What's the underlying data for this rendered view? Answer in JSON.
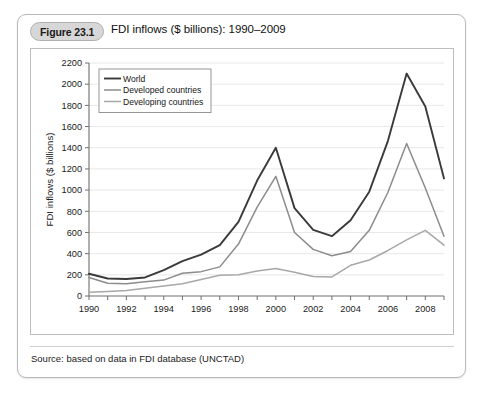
{
  "figure": {
    "badge": "Figure 23.1",
    "title": "FDI inflows ($ billions): 1990–2009",
    "source": "Source: based on data in FDI database (UNCTAD)"
  },
  "colors": {
    "card_border": "#b9b9b9",
    "badge_bg": "#d7d7d7",
    "plot_border": "#bdbdbd",
    "grid": "#e2e2e2",
    "axis": "#6f6f6f",
    "world": "#3a3a3a",
    "developed": "#8c8c8c",
    "developing": "#a8a8a8"
  },
  "chart_data": {
    "type": "line",
    "title": "FDI inflows ($ billions): 1990–2009",
    "xlabel": "",
    "ylabel": "FDI inflows ($ billions)",
    "xlim": [
      1990,
      2009
    ],
    "ylim": [
      0,
      2200
    ],
    "grid": true,
    "legend_position": "top-left",
    "ytick_labels": [
      "0",
      "200",
      "400",
      "600",
      "800",
      "1000",
      "1200",
      "1400",
      "1600",
      "1800",
      "2000",
      "2200"
    ],
    "yticks": [
      0,
      200,
      400,
      600,
      800,
      1000,
      1200,
      1400,
      1600,
      1800,
      2000,
      2200
    ],
    "xticks": [
      1990,
      1991,
      1992,
      1993,
      1994,
      1995,
      1996,
      1997,
      1998,
      1999,
      2000,
      2001,
      2002,
      2003,
      2004,
      2005,
      2006,
      2007,
      2008,
      2009
    ],
    "xtick_labels_shown": [
      "1990",
      "1992",
      "1994",
      "1996",
      "1998",
      "2000",
      "2002",
      "2004",
      "2006",
      "2008"
    ],
    "x": [
      1990,
      1991,
      1992,
      1993,
      1994,
      1995,
      1996,
      1997,
      1998,
      1999,
      2000,
      2001,
      2002,
      2003,
      2004,
      2005,
      2006,
      2007,
      2008,
      2009
    ],
    "series": [
      {
        "name": "World",
        "color": "#3a3a3a",
        "values": [
          210,
          165,
          160,
          175,
          245,
          330,
          390,
          480,
          700,
          1090,
          1400,
          830,
          625,
          565,
          715,
          985,
          1465,
          2100,
          1790,
          1110
        ]
      },
      {
        "name": "Developed countries",
        "color": "#8c8c8c",
        "values": [
          175,
          120,
          115,
          135,
          150,
          215,
          230,
          275,
          490,
          840,
          1130,
          600,
          440,
          380,
          420,
          620,
          980,
          1440,
          1020,
          565
        ]
      },
      {
        "name": "Developing countries",
        "color": "#a8a8a8",
        "values": [
          35,
          42,
          52,
          73,
          95,
          115,
          155,
          195,
          200,
          235,
          260,
          225,
          185,
          180,
          290,
          340,
          430,
          530,
          620,
          480
        ]
      }
    ]
  }
}
